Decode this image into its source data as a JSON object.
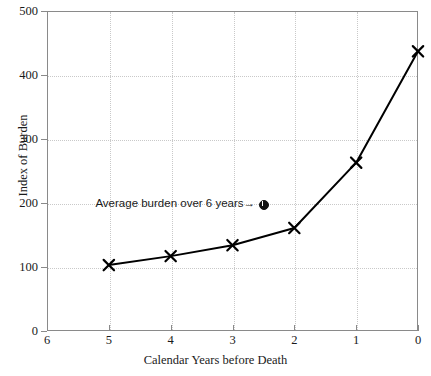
{
  "chart_data": {
    "type": "line",
    "title": "",
    "xlabel": "Calendar Years before Death",
    "ylabel": "Index of Burden",
    "x": [
      5,
      4,
      3,
      2,
      1,
      0
    ],
    "values": [
      103,
      117,
      134,
      161,
      263,
      437
    ],
    "series": [
      {
        "name": "Index of Burden",
        "x": [
          5,
          4,
          3,
          2,
          1,
          0
        ],
        "values": [
          103,
          117,
          134,
          161,
          263,
          437
        ],
        "marker": "x",
        "color": "#000000"
      }
    ],
    "xlim": [
      6,
      0
    ],
    "ylim": [
      0,
      500
    ],
    "x_inverted": true,
    "xticks": [
      6,
      5,
      4,
      3,
      2,
      1,
      0
    ],
    "yticks": [
      0,
      100,
      200,
      300,
      400,
      500
    ],
    "xticklabels": [
      "6",
      "5",
      "4",
      "3",
      "2",
      "1",
      "0"
    ],
    "yticklabels": [
      "0",
      "100",
      "200",
      "300",
      "400",
      "500"
    ],
    "grid": true,
    "grid_style": "dotted",
    "legend": false,
    "annotations": [
      {
        "text": "Average burden over 6 years→",
        "x": 2.5,
        "y": 199,
        "marker": "filled-circle",
        "marker_value": 199
      }
    ],
    "colors": {
      "line": "#000000",
      "grid": "#c9c9c9",
      "axis": "#8a8a8a",
      "text": "#1a1a1a",
      "background": "#ffffff"
    }
  },
  "axes": {
    "y_tick_labels": [
      "500",
      "400",
      "300",
      "200",
      "100",
      "0"
    ],
    "x_tick_labels": [
      "6",
      "5",
      "4",
      "3",
      "2",
      "1",
      "0"
    ],
    "x_title": "Calendar Years before Death",
    "y_title": "Index of Burden"
  },
  "annotation": {
    "label": "Average burden over 6 years→"
  }
}
